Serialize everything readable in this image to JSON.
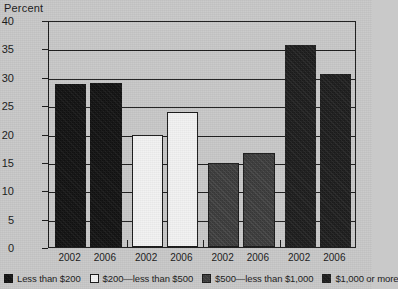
{
  "chart_data": {
    "type": "bar",
    "title": "",
    "xlabel": "",
    "ylabel": "Percent",
    "ylim": [
      0,
      40
    ],
    "yticks": [
      0,
      5,
      10,
      15,
      20,
      25,
      30,
      35,
      40
    ],
    "grid": true,
    "legend_position": "bottom",
    "categories": [
      "2002",
      "2006"
    ],
    "series": [
      {
        "name": "Less than $200",
        "values": [
          28.8,
          28.9
        ],
        "color": "#121212",
        "fill": "f-black"
      },
      {
        "name": "$200—less than $500",
        "values": [
          19.7,
          23.8
        ],
        "color": "#f2f2f2",
        "fill": "f-white"
      },
      {
        "name": "$500—less than $1,000",
        "values": [
          14.8,
          16.6
        ],
        "color": "#3b3b3b",
        "fill": "f-gray"
      },
      {
        "name": "$1,000 or more",
        "values": [
          35.6,
          30.5
        ],
        "color": "#1d1d1d",
        "fill": "f-dark"
      }
    ],
    "bars": [
      {
        "group": "Less than $200",
        "year": "2002",
        "value": 28.8,
        "fill": "f-black"
      },
      {
        "group": "Less than $200",
        "year": "2006",
        "value": 28.9,
        "fill": "f-black"
      },
      {
        "group": "$200—less than $500",
        "year": "2002",
        "value": 19.7,
        "fill": "f-white"
      },
      {
        "group": "$200—less than $500",
        "year": "2006",
        "value": 23.8,
        "fill": "f-white"
      },
      {
        "group": "$500—less than $1,000",
        "year": "2002",
        "value": 14.8,
        "fill": "f-gray"
      },
      {
        "group": "$500—less than $1,000",
        "year": "2006",
        "value": 16.6,
        "fill": "f-gray"
      },
      {
        "group": "$1,000 or more",
        "year": "2002",
        "value": 35.6,
        "fill": "f-dark"
      },
      {
        "group": "$1,000 or more",
        "year": "2006",
        "value": 30.5,
        "fill": "f-dark"
      }
    ]
  },
  "axis": {
    "y_title": "Percent"
  }
}
